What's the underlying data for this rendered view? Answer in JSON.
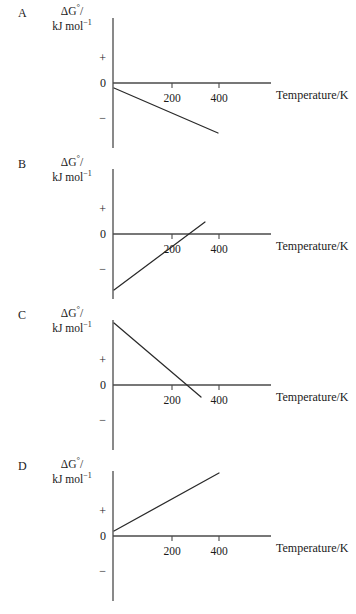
{
  "figure": {
    "axis_labels": {
      "y_line1_delta": "ΔG",
      "y_line1_degree": "°",
      "y_line1_slash": "/",
      "y_line2_main": "kJ mol",
      "y_line2_sup": "−1",
      "x_title": "Temperature/K",
      "sign_positive": "+",
      "sign_zero": "0",
      "sign_negative": "−",
      "tick_200": "200",
      "tick_400": "400"
    },
    "axis_geometry": {
      "y_axis_x": 113,
      "zero_y": 83,
      "x_axis_end": 271,
      "tick_200_x": 172,
      "tick_400_x": 219,
      "y_axis_top": 18,
      "y_axis_bottom": 148,
      "tick_length": 5
    },
    "panels": [
      {
        "letter": "A",
        "top": 0,
        "description": "negative intercept, negative slope, stays negative",
        "line": {
          "x1": 114,
          "y1": 88,
          "x2": 218,
          "y2": 133
        }
      },
      {
        "letter": "B",
        "top": 151,
        "description": "negative intercept, positive slope, crosses zero near 300 K",
        "line": {
          "x1": 114,
          "y1": 139,
          "x2": 205,
          "y2": 71
        }
      },
      {
        "letter": "C",
        "top": 302,
        "description": "positive intercept, negative slope, crosses zero near 300 K",
        "line": {
          "x1": 114,
          "y1": 21,
          "x2": 201,
          "y2": 95
        }
      },
      {
        "letter": "D",
        "top": 453,
        "description": "positive intercept, positive slope, stays positive",
        "line": {
          "x1": 114,
          "y1": 78,
          "x2": 219,
          "y2": 20
        }
      }
    ]
  },
  "chart_data": {
    "type": "line",
    "title": "",
    "xlabel": "Temperature/K",
    "ylabel": "ΔG°/kJ mol−1",
    "x_ticks": [
      200,
      400
    ],
    "y_ticks": [
      "+",
      "0",
      "−"
    ],
    "grid": false,
    "legend": "none",
    "panels": [
      {
        "label": "A",
        "series_name": "A",
        "intercept_sign": "negative",
        "slope_sign": "negative",
        "crosses_zero": false,
        "x": [
          0,
          460
        ],
        "y_relative": [
          -0.1,
          -1.0
        ]
      },
      {
        "label": "B",
        "series_name": "B",
        "intercept_sign": "negative",
        "slope_sign": "positive",
        "crosses_zero": true,
        "zero_crossing_K": 300,
        "x": [
          0,
          390
        ],
        "y_relative": [
          -1.0,
          0.25
        ]
      },
      {
        "label": "C",
        "series_name": "C",
        "intercept_sign": "positive",
        "slope_sign": "negative",
        "crosses_zero": true,
        "zero_crossing_K": 300,
        "x": [
          0,
          375
        ],
        "y_relative": [
          1.0,
          -0.2
        ]
      },
      {
        "label": "D",
        "series_name": "D",
        "intercept_sign": "positive",
        "slope_sign": "positive",
        "crosses_zero": false,
        "x": [
          0,
          450
        ],
        "y_relative": [
          0.07,
          0.9
        ]
      }
    ]
  }
}
